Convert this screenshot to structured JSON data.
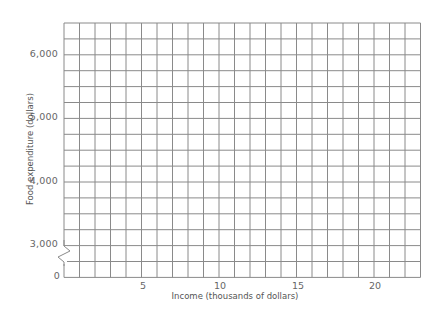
{
  "chart_data": {
    "type": "line",
    "title": "",
    "xlabel": "Income (thousands of dollars)",
    "ylabel": "Food expenditure (dollars)",
    "x_ticks": [
      5,
      10,
      15,
      20
    ],
    "y_ticks": [
      0,
      3000,
      4000,
      5000,
      6000
    ],
    "y_tick_labels": [
      "0",
      "3,000",
      "4,000",
      "5,000",
      "6,000"
    ],
    "xlim": [
      0,
      23
    ],
    "ylim": [
      3000,
      6500
    ],
    "y_axis_break": {
      "from": 0,
      "to": 3000
    },
    "grid": true,
    "grid_x_step": 1,
    "grid_y_step": 250,
    "series": [],
    "legend": null
  },
  "labels": {
    "y": [
      "6,000",
      "5,000",
      "4,000",
      "3,000",
      "0"
    ],
    "x": [
      "5",
      "10",
      "15",
      "20"
    ],
    "xtitle": "Income (thousands of dollars)",
    "ytitle": "Food expenditure (dollars)"
  },
  "colors": {
    "grid": "#8a8a8a",
    "text": "#666666"
  }
}
